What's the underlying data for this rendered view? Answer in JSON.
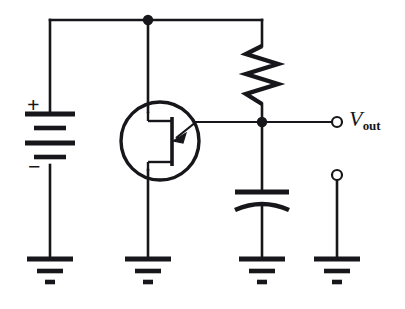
{
  "figure": {
    "kind": "circuit-schematic",
    "title": "",
    "background_color": "#ffffff",
    "ink_color": "#17161a",
    "width": 405,
    "height": 309
  },
  "labels": {
    "vout_symbol": "V",
    "vout_subscript": "out",
    "battery_plus": "+",
    "battery_minus": "−"
  },
  "components": [
    {
      "id": "battery",
      "name": "dc-voltage-source",
      "type": "battery",
      "terminal_labels": [
        "+",
        "−"
      ],
      "plate_count": 4,
      "orientation": "vertical",
      "x": 50,
      "top_y": 113,
      "bottom_y": 165
    },
    {
      "id": "transistor",
      "name": "field-effect-transistor",
      "type": "fet",
      "enclosure": "circle",
      "center_x": 160,
      "center_y": 141,
      "radius": 39,
      "gate_direction": "right",
      "arrow_direction": "into-channel"
    },
    {
      "id": "resistor",
      "name": "load-resistor",
      "type": "resistor",
      "orientation": "vertical",
      "x": 262,
      "top_y": 46,
      "bottom_y": 104,
      "zigzag_peaks": 6
    },
    {
      "id": "capacitor",
      "name": "output-capacitor",
      "type": "capacitor-polarized",
      "orientation": "vertical",
      "x": 262,
      "plate_top_y": 192,
      "plate_bottom_y": 206
    },
    {
      "id": "output-terminal",
      "name": "vout-terminal",
      "type": "open-terminal",
      "x": 337,
      "y": 122
    },
    {
      "id": "reference-terminal",
      "name": "reference-terminal",
      "type": "open-terminal",
      "x": 337,
      "y": 175
    }
  ],
  "grounds": [
    {
      "id": "gnd-battery",
      "name": "ground-battery",
      "x": 50,
      "y": 258
    },
    {
      "id": "gnd-transistor",
      "name": "ground-transistor",
      "x": 148,
      "y": 258
    },
    {
      "id": "gnd-capacitor",
      "name": "ground-capacitor",
      "x": 262,
      "y": 258
    },
    {
      "id": "gnd-reference",
      "name": "ground-reference",
      "x": 337,
      "y": 258
    }
  ],
  "junctions": [
    {
      "id": "node-supply",
      "name": "supply-node",
      "x": 148,
      "y": 20
    },
    {
      "id": "node-output",
      "name": "output-node",
      "x": 262,
      "y": 122
    }
  ],
  "wires": {
    "top_rail_y": 20,
    "output_rail_y": 122,
    "left_branch_x": 50,
    "mid_branch_x": 148,
    "right_branch_x": 262,
    "terminal_branch_x": 337
  }
}
